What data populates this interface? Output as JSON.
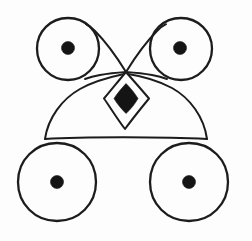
{
  "figure": {
    "canvas": {
      "width": 252,
      "height": 241
    },
    "colors": {
      "background": "#fdfdfd",
      "stroke": "#1c1c1c",
      "fill": "#141414"
    },
    "shapes": {
      "circle_top_left": {
        "name": "top-left circle",
        "cx": 68,
        "cy": 49,
        "r": 31,
        "dot_r": 6.5,
        "dot_cx": 68,
        "dot_cy": 48
      },
      "circle_top_right": {
        "name": "top-right circle",
        "cx": 181,
        "cy": 49,
        "r": 31,
        "dot_r": 6.5,
        "dot_cx": 180,
        "dot_cy": 48
      },
      "circle_bottom_left": {
        "name": "bottom-left circle",
        "cx": 57,
        "cy": 182,
        "r": 39,
        "dot_r": 6.5,
        "dot_cx": 57,
        "dot_cy": 182
      },
      "circle_bottom_right": {
        "name": "bottom-right circle",
        "cx": 189,
        "cy": 182,
        "r": 39,
        "dot_r": 6.5,
        "dot_cx": 189,
        "dot_cy": 182
      },
      "crossing_point": {
        "name": "central crossing node",
        "x": 126,
        "y": 72
      },
      "diamond_outer": {
        "name": "outer diamond outline",
        "top_x": 126,
        "top_y": 72,
        "right_x": 149,
        "right_y": 99,
        "bottom_x": 125,
        "bottom_y": 129,
        "left_x": 103,
        "left_y": 99
      },
      "diamond_inner": {
        "name": "solid black inner diamond",
        "cx": 126,
        "cy": 98,
        "half_width": 12,
        "half_height": 15
      },
      "dome_arc": {
        "name": "wide dome arc",
        "left_x": 45,
        "left_y": 139,
        "apex_x": 126,
        "apex_y": 85,
        "right_x": 207,
        "right_y": 139
      },
      "baseline": {
        "name": "horizontal baseline",
        "x1": 45,
        "y1": 139,
        "x2": 207,
        "y2": 139
      }
    },
    "element_counts": {
      "circles": 4,
      "center_dots": 4,
      "diamonds": 2,
      "arcs": 5,
      "lines": 1
    }
  }
}
